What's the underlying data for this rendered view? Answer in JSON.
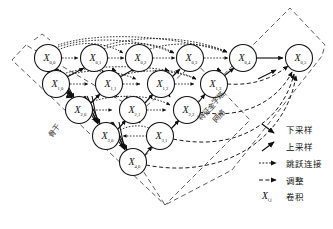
{
  "diagram": {
    "node_prefix": "X",
    "nodes": [
      {
        "id": "X00",
        "label": "X",
        "sub": "0,0",
        "x": 48,
        "y": 58,
        "r": 13.5
      },
      {
        "id": "X01",
        "label": "X",
        "sub": "0,1",
        "x": 94,
        "y": 58,
        "r": 13.5
      },
      {
        "id": "X02",
        "label": "X",
        "sub": "0,2",
        "x": 139,
        "y": 58,
        "r": 13.5
      },
      {
        "id": "X03",
        "label": "X",
        "sub": "0,3",
        "x": 190,
        "y": 58,
        "r": 13.5
      },
      {
        "id": "X04",
        "label": "X",
        "sub": "0,4",
        "x": 243,
        "y": 58,
        "r": 13.5
      },
      {
        "id": "X05",
        "label": "X",
        "sub": "0,5",
        "x": 299,
        "y": 58,
        "r": 13.5
      },
      {
        "id": "X10",
        "label": "X",
        "sub": "1,0",
        "x": 56,
        "y": 84,
        "r": 13.5
      },
      {
        "id": "X11",
        "label": "X",
        "sub": "1,1",
        "x": 109,
        "y": 84,
        "r": 13.5
      },
      {
        "id": "X12",
        "label": "X",
        "sub": "1,2",
        "x": 161,
        "y": 84,
        "r": 13.5
      },
      {
        "id": "X13",
        "label": "X",
        "sub": "1,3",
        "x": 214,
        "y": 84,
        "r": 13.5
      },
      {
        "id": "X20",
        "label": "X",
        "sub": "2,0",
        "x": 79,
        "y": 110,
        "r": 13.5
      },
      {
        "id": "X21",
        "label": "X",
        "sub": "2,1",
        "x": 133,
        "y": 110,
        "r": 13.5
      },
      {
        "id": "X22",
        "label": "X",
        "sub": "2,2",
        "x": 187,
        "y": 110,
        "r": 13.5
      },
      {
        "id": "X30",
        "label": "X",
        "sub": "3,0",
        "x": 106,
        "y": 136,
        "r": 13.5
      },
      {
        "id": "X31",
        "label": "X",
        "sub": "3,1",
        "x": 160,
        "y": 136,
        "r": 13.5
      },
      {
        "id": "X40",
        "label": "X",
        "sub": "4,0",
        "x": 133,
        "y": 162,
        "r": 13.5
      }
    ],
    "annotations": [
      {
        "id": "backbone",
        "text": "骨干",
        "x": 56,
        "y": 132,
        "rotate": -52
      },
      {
        "id": "fpn-line1",
        "text": "特征金字塔",
        "x": 213,
        "y": 108,
        "rotate": -48
      },
      {
        "id": "fpn-line2",
        "text": "网络",
        "x": 221,
        "y": 118,
        "rotate": -48
      }
    ]
  },
  "legend": {
    "items": [
      {
        "id": "downsample",
        "label": "下采样",
        "glyph": "solid-arrow-down-right"
      },
      {
        "id": "upsample",
        "label": "上采样",
        "glyph": "solid-arrow-up-right"
      },
      {
        "id": "skip-connection",
        "label": "跳跃连接",
        "glyph": "dotted-arrow-right"
      },
      {
        "id": "adjust",
        "label": "调整",
        "glyph": "dashed-arrow-right"
      },
      {
        "id": "convolution",
        "label": "卷积",
        "glyph": "X-ij",
        "symbol": "X",
        "symbol_sub": "i,j"
      }
    ]
  },
  "colors": {
    "stroke": "#1a1a1a",
    "node_fill": "#ffffff",
    "dashed_outline": "#4a4a4a",
    "background": "#ffffff"
  }
}
